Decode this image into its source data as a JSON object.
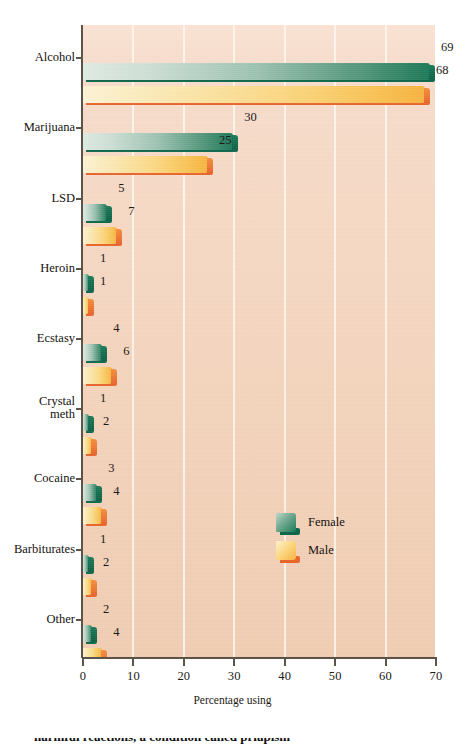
{
  "chart_data": {
    "type": "bar",
    "orientation": "horizontal",
    "title": "",
    "subtitle": "",
    "xlabel": "Percentage using",
    "ylabel": "",
    "xlim": [
      0,
      70
    ],
    "xticks": [
      0,
      10,
      20,
      30,
      40,
      50,
      60,
      70
    ],
    "xtick_labels": [
      "0",
      "10",
      "20",
      "30",
      "40",
      "50",
      "60",
      "70"
    ],
    "grid": "vertical",
    "legend_position": "inside-right-lower",
    "categories": [
      "Alcohol",
      "Marijuana",
      "LSD",
      "Heroin",
      "Ecstasy",
      "Crystal\nmeth",
      "Cocaine",
      "Barbiturates",
      "Other"
    ],
    "series": [
      {
        "name": "Female",
        "color": "#1e7a5a",
        "values": [
          69,
          30,
          5,
          1,
          4,
          1,
          3,
          1,
          2
        ]
      },
      {
        "name": "Male",
        "color": "#f7b341",
        "values": [
          68,
          25,
          7,
          1,
          6,
          2,
          4,
          2,
          4
        ]
      }
    ],
    "colors": {
      "female_light": "#dfeae2",
      "female_dark": "#1e7a5a",
      "female_shadow": "#10684c",
      "male_light": "#fdf3d5",
      "male_dark": "#f7b341",
      "male_shadow": "#e8662e",
      "panel_top": "#fbe3d4",
      "panel_bottom": "#f0cdb3",
      "axis": "#5e5347",
      "gridline": "#fffdf6",
      "text": "#16130f"
    }
  },
  "legend": {
    "items": [
      {
        "label": "Female"
      },
      {
        "label": "Male"
      }
    ]
  },
  "axis": {
    "x_title": "Percentage using"
  },
  "page": {
    "body_text_fragment": "harmful reactions, a condition called priapism"
  }
}
